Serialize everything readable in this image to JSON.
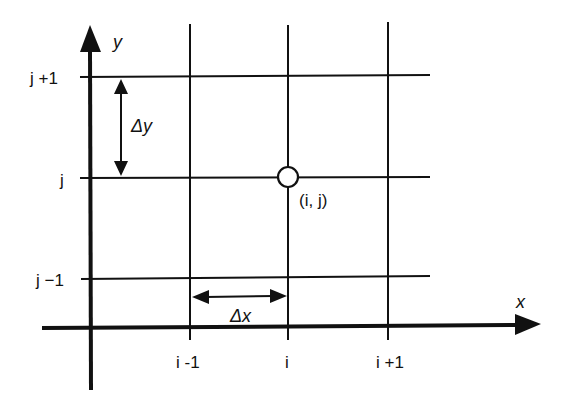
{
  "diagram": {
    "type": "finite-difference-grid",
    "axes": {
      "x_label": "x",
      "y_label": "y"
    },
    "column_labels": [
      "i-1",
      "i",
      "i+1"
    ],
    "row_labels": [
      "j+1",
      "j",
      "j-1"
    ],
    "node": {
      "label": "(i, j)",
      "column": "i",
      "row": "j"
    },
    "spacing": {
      "dx_label": "Δx",
      "dy_label": "Δy"
    },
    "colors": {
      "ink": "#111111",
      "background": "#ffffff"
    }
  }
}
